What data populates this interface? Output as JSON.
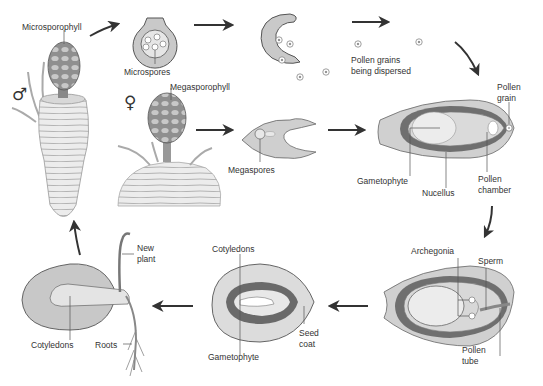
{
  "diagram": {
    "colors": {
      "tissue": "#c9c9c9",
      "tissue_light": "#e2e2e2",
      "dark_band": "#6e6e6e",
      "outline": "#555555",
      "arrow": "#333333",
      "label": "#333333"
    },
    "symbols": {
      "male": "♂",
      "female": "♀"
    },
    "labels": {
      "microsporophyll": "Microsporophyll",
      "microspores": "Microspores",
      "megasporophyll": "Megasporophyll",
      "megaspores": "Megaspores",
      "pollen_dispersed_line1": "Pollen grains",
      "pollen_dispersed_line2": "being dispersed",
      "pollen_grain_line1": "Pollen",
      "pollen_grain_line2": "grain",
      "gametophyte_ovule": "Gametophyte",
      "nucellus": "Nucellus",
      "pollen_chamber_line1": "Pollen",
      "pollen_chamber_line2": "chamber",
      "archegonia": "Archegonia",
      "sperm": "Sperm",
      "pollen_tube_line1": "Pollen",
      "pollen_tube_line2": "tube",
      "cotyledons_seed": "Cotyledons",
      "gametophyte_seed": "Gametophyte",
      "seed_coat_line1": "Seed",
      "seed_coat_line2": "coat",
      "new_plant_line1": "New",
      "new_plant_line2": "plant",
      "cotyledons_seedling": "Cotyledons",
      "roots": "Roots"
    },
    "stages": [
      "Male cone plant",
      "Microsporangium with microspores",
      "Open microsporangium releasing pollen",
      "Pollen grains being dispersed",
      "Female cone plant",
      "Megasporangium with megaspores",
      "Ovule receiving pollen grain",
      "Ovule with archegonia and pollen tube",
      "Seed with embryo",
      "Germinating seedling"
    ]
  }
}
